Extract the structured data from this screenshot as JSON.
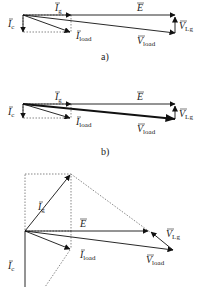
{
  "panels": [
    {
      "caption": "a)",
      "labels": {
        "Ig": {
          "main": "I",
          "sub": "g"
        },
        "E": {
          "main": "E",
          "sub": ""
        },
        "Ic": {
          "main": "I",
          "sub": "c"
        },
        "Iload": {
          "main": "I",
          "sub": "load"
        },
        "Vload": {
          "main": "V",
          "sub": "load"
        },
        "VLg": {
          "main": "V",
          "sub": "Lg"
        }
      }
    },
    {
      "caption": "b)",
      "labels": {
        "Ig": {
          "main": "I",
          "sub": "g"
        },
        "E": {
          "main": "E",
          "sub": ""
        },
        "Ic": {
          "main": "I",
          "sub": "c"
        },
        "Iload": {
          "main": "I",
          "sub": "load"
        },
        "Vload": {
          "main": "V",
          "sub": "load"
        },
        "VLg": {
          "main": "V",
          "sub": "Lg"
        }
      }
    },
    {
      "caption": "",
      "labels": {
        "Ig": {
          "main": "I",
          "sub": "g"
        },
        "E": {
          "main": "E",
          "sub": ""
        },
        "Ic": {
          "main": "I",
          "sub": "c"
        },
        "Iload": {
          "main": "I",
          "sub": "load"
        },
        "Vload": {
          "main": "V",
          "sub": "load"
        },
        "VLg": {
          "main": "V",
          "sub": "Lg"
        }
      }
    }
  ]
}
